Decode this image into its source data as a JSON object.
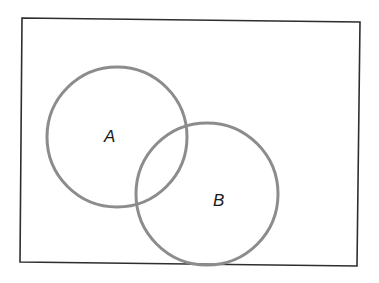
{
  "diagram": {
    "type": "venn",
    "universe": {
      "points": [
        [
          22,
          18
        ],
        [
          360,
          22
        ],
        [
          357,
          266
        ],
        [
          20,
          262
        ]
      ],
      "stroke": "#2e2e2e"
    },
    "sets": [
      {
        "label": "A",
        "cx": 117,
        "cy": 137,
        "r": 70,
        "label_x": 104,
        "label_y": 142,
        "stroke": "#8c8c8c"
      },
      {
        "label": "B",
        "cx": 207,
        "cy": 194,
        "r": 71,
        "label_x": 213,
        "label_y": 206,
        "stroke": "#8c8c8c"
      }
    ]
  }
}
